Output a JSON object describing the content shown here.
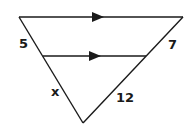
{
  "diagram": {
    "type": "geometry-figure",
    "stroke_color": "#1a1a1a",
    "labels": {
      "left_upper": "5",
      "right_upper": "7",
      "left_lower": "x",
      "right_lower": "12"
    },
    "parallel_marks": "arrows"
  }
}
